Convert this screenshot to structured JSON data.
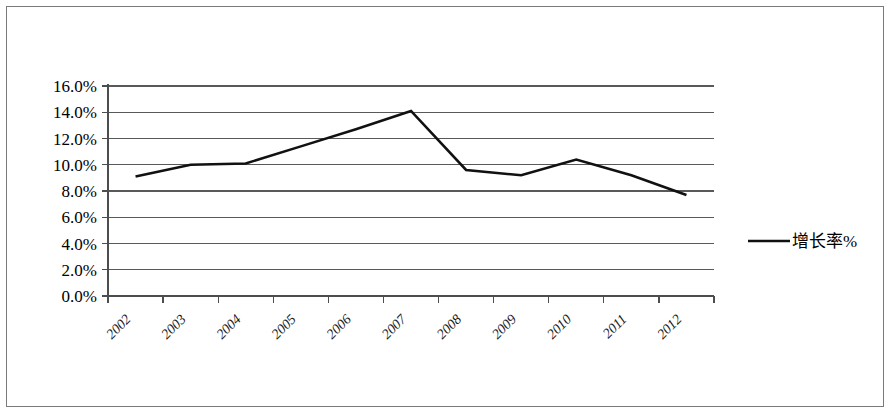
{
  "chart_data": {
    "type": "line",
    "title": "",
    "xlabel": "",
    "ylabel": "",
    "categories": [
      "2002",
      "2003",
      "2004",
      "2005",
      "2006",
      "2007",
      "2008",
      "2009",
      "2010",
      "2011",
      "2012"
    ],
    "series": [
      {
        "name": "增长率%",
        "values": [
          9.1,
          10.0,
          10.1,
          11.4,
          12.7,
          14.1,
          9.6,
          9.2,
          10.4,
          9.2,
          7.7
        ]
      }
    ],
    "ylim": [
      0.0,
      16.0
    ],
    "ytick_values": [
      16.0,
      14.0,
      12.0,
      10.0,
      8.0,
      6.0,
      4.0,
      2.0,
      0.0
    ],
    "ytick_labels": [
      "16.0%",
      "14.0%",
      "12.0%",
      "10.0%",
      "8.0%",
      "6.0%",
      "4.0%",
      "2.0%",
      "0.0%"
    ],
    "grid": true,
    "grid_axis": "y",
    "legend_position": "right",
    "series_color": "#111111",
    "gridline_color": "#595959",
    "axis_color": "#4d4d4d",
    "background_color": "#ffffff",
    "border_color": "#7a7a7a",
    "xtick_label_rotation": -45
  },
  "legend": {
    "entries": [
      {
        "label": "增长率%",
        "marker": "line-marker",
        "color": "#111111"
      }
    ]
  },
  "axes": {
    "y_axis_name": "percent-axis",
    "x_axis_name": "year-axis"
  }
}
